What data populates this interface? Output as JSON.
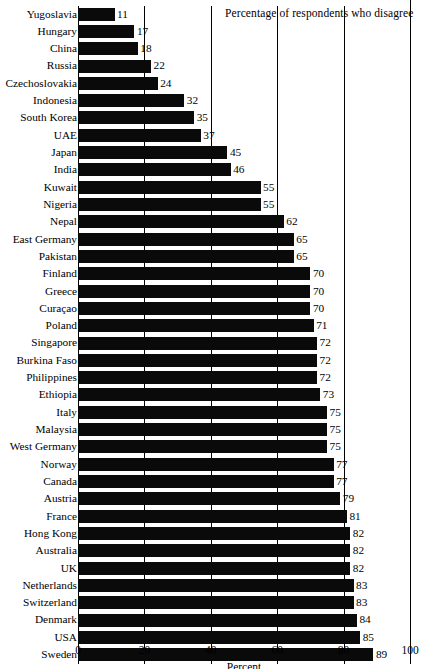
{
  "chart_data": {
    "type": "bar",
    "orientation": "horizontal",
    "title": "Percentage of respondents who disagree",
    "xlabel": "Percent",
    "ylabel": "",
    "xlim": [
      0,
      100
    ],
    "xticks": [
      0,
      20,
      40,
      60,
      80,
      100
    ],
    "grid": true,
    "legend": false,
    "bar_color": "#0a0a0a",
    "categories": [
      "Yugoslavia",
      "Hungary",
      "China",
      "Russia",
      "Czechoslovakia",
      "Indonesia",
      "South Korea",
      "UAE",
      "Japan",
      "India",
      "Kuwait",
      "Nigeria",
      "Nepal",
      "East Germany",
      "Pakistan",
      "Finland",
      "Greece",
      "Curaçao",
      "Poland",
      "Singapore",
      "Burkina Faso",
      "Philippines",
      "Ethiopia",
      "Italy",
      "Malaysia",
      "West Germany",
      "Norway",
      "Canada",
      "Austria",
      "France",
      "Hong Kong",
      "Australia",
      "UK",
      "Netherlands",
      "Switzerland",
      "Denmark",
      "USA",
      "Sweden"
    ],
    "values": [
      11,
      17,
      18,
      22,
      24,
      32,
      35,
      37,
      45,
      46,
      55,
      55,
      62,
      65,
      65,
      70,
      70,
      70,
      71,
      72,
      72,
      72,
      73,
      75,
      75,
      75,
      77,
      77,
      79,
      81,
      82,
      82,
      82,
      83,
      83,
      84,
      85,
      89
    ],
    "value_labels": [
      "11",
      "17",
      "18",
      "22",
      "24",
      "32",
      "35",
      "37",
      "45",
      "46",
      "55",
      "55",
      "62",
      "65",
      "65",
      "70",
      "70",
      "70",
      "71",
      "72",
      "72",
      "72",
      "73",
      "75",
      "75",
      "75",
      "77",
      "77",
      "79",
      "81",
      "82",
      "82",
      "82",
      "83",
      "83",
      "84",
      "85",
      "89"
    ]
  },
  "axis": {
    "tick_labels": [
      "0",
      "20",
      "40",
      "60",
      "80",
      "100"
    ],
    "title": "Percent"
  }
}
